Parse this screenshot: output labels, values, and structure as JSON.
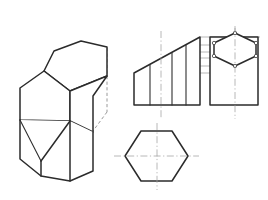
{
  "sheet": {
    "title": "Truncated Hexagonal Prism — Pictorial and Orthographic Views",
    "caption": "",
    "background_color": "#ffffff",
    "width": 268,
    "height": 200
  },
  "style": {
    "visible_edge_color": "#2b2b2b",
    "hidden_edge_color": "#8e8e8e",
    "projection_line_color": "#9a9a9a",
    "center_line_color": "#a0a0a0",
    "vertex_marker_fill": "#ffffff"
  },
  "views": {
    "isometric": {
      "name": "Isometric pictorial view",
      "label": "",
      "top_face_polygon": "44,71 54,51 81,41 107,47 107,75 70,90",
      "left_upper_face_polygon": "20,88 44,71 70,90 70,120 20,119",
      "right_upper_face_polygon": "107,47 107,75 70,90 70,120 93,131 93,96",
      "lower_prism_outline": "20,119 20,158 40,175 70,180 93,170 93,131 70,120",
      "base_left_edge": "20,158 40,175",
      "base_front_edge": "40,175 70,180",
      "base_right_edge": "70,180 93,170",
      "vertical_edge_left": "20,88 20,158",
      "vertical_edge_mid_front": "70,120 70,180",
      "vertical_edge_right": "93,96 93,170",
      "vertical_edge_corner": "40,160 40,175",
      "hidden_edges": [
        "54,51 54,112",
        "107,47 107,112",
        "20,119 54,136 93,131",
        "54,112 54,136",
        "107,112 93,131",
        "40,160 54,136",
        "54,136 70,120"
      ]
    },
    "front_view": {
      "name": "Front elevation view",
      "label": "",
      "outline_polygon": "134,105 134,73 200,37 200,105",
      "inclined_top_edge": "134,73 200,37",
      "bottom_edge": "134,105 200,105",
      "left_edge": "134,73 134,105",
      "right_edge": "200,37 200,105",
      "internal_vertical_lines": [
        "150,105 150,64",
        "172,105 172,52",
        "184,105 184,45"
      ],
      "center_line_vertical": "161,32 161,118"
    },
    "side_view": {
      "name": "Side elevation view with end hexagon",
      "label": "",
      "outline_polygon": "210,105 210,37 258,37 258,105",
      "bottom_edge": "210,105 258,105",
      "left_edge": "210,37 210,105",
      "right_edge": "258,37 258,105",
      "top_edge": "210,37 258,37",
      "hexagon_polygon": "235,33 256,43 256,56 235,66 214,56 214,43",
      "center_line_vertical": "235,26 235,118",
      "vertex_markers": [
        {
          "cx": 235,
          "cy": 33,
          "r": 1.6
        },
        {
          "cx": 256,
          "cy": 43,
          "r": 1.6
        },
        {
          "cx": 256,
          "cy": 56,
          "r": 1.6
        },
        {
          "cx": 235,
          "cy": 66,
          "r": 1.6
        },
        {
          "cx": 214,
          "cy": 56,
          "r": 1.6
        },
        {
          "cx": 214,
          "cy": 43,
          "r": 1.6
        }
      ]
    },
    "top_view": {
      "name": "Top plan view hexagon",
      "label": "",
      "hexagon_polygon": "141,131 172,131 188,156 172,181 141,181 125,156",
      "center_line_horizontal": "114,156 199,156",
      "center_line_vertical": "157,124 157,189"
    }
  },
  "projection_lines": {
    "name": "Projection reference lines",
    "lines": [
      "200,37 258,37",
      "200,45 256,45",
      "200,52 256,52",
      "200,58 256,58",
      "134,73 210,73",
      "140,30 140,105",
      "200,37 200,105"
    ]
  }
}
